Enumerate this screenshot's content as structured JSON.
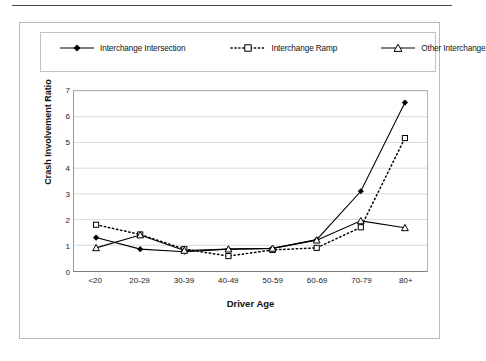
{
  "chart_data": {
    "type": "line",
    "title": "",
    "xlabel": "Driver Age",
    "ylabel": "Crash Involvement Ratio",
    "categories": [
      "<20",
      "20-29",
      "30-39",
      "40-49",
      "50-59",
      "60-69",
      "70-79",
      "80+"
    ],
    "ylim": [
      0,
      7
    ],
    "yticks": [
      "0",
      "1",
      "2",
      "3",
      "4",
      "5",
      "6",
      "7"
    ],
    "grid": true,
    "legend_position": "top",
    "series": [
      {
        "name": "Interchange Intersection",
        "marker": "filled-diamond",
        "line_style": "solid",
        "color": "#000000",
        "values": [
          1.3,
          0.85,
          0.75,
          0.85,
          0.88,
          1.22,
          3.1,
          6.55
        ]
      },
      {
        "name": "Interchange Ramp",
        "marker": "open-square",
        "line_style": "dotted",
        "color": "#000000",
        "values": [
          1.8,
          1.42,
          0.85,
          0.58,
          0.82,
          0.9,
          1.7,
          5.17
        ]
      },
      {
        "name": "Other Interchange",
        "marker": "open-triangle",
        "line_style": "solid",
        "color": "#000000",
        "values": [
          0.9,
          1.4,
          0.8,
          0.85,
          0.88,
          1.2,
          1.95,
          1.68
        ]
      }
    ]
  },
  "legend": {
    "items": [
      {
        "label": "Interchange Intersection",
        "key": "filled-diamond-solid-key"
      },
      {
        "label": "Interchange Ramp",
        "key": "open-square-dotted-key"
      },
      {
        "label": "Other Interchange",
        "key": "open-triangle-solid-key"
      }
    ]
  }
}
